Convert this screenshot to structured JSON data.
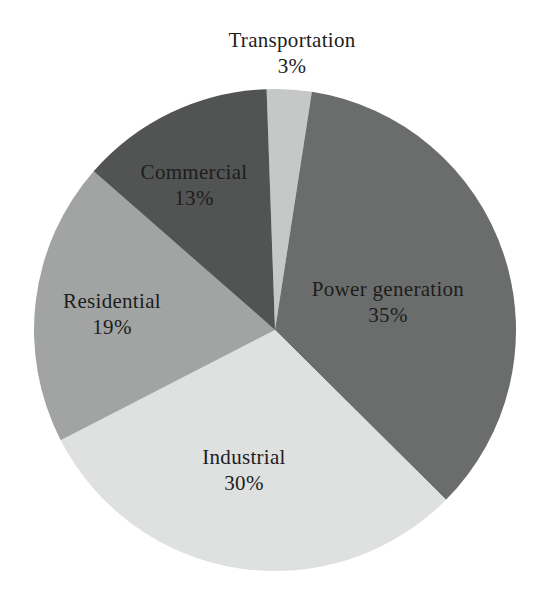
{
  "figure": {
    "background": "#ffffff",
    "text_color": "#1d1d1d"
  },
  "chart_data": {
    "type": "pie",
    "title": "",
    "categories": [
      "Transportation",
      "Power generation",
      "Industrial",
      "Residential",
      "Commercial"
    ],
    "values": [
      3,
      35,
      30,
      19,
      13
    ],
    "unit": "%",
    "slices": [
      {
        "label": "Transportation",
        "value": 3,
        "display": "3%",
        "color": "#c6c8c7"
      },
      {
        "label": "Power generation",
        "value": 35,
        "display": "35%",
        "color": "#6b6d6c"
      },
      {
        "label": "Industrial",
        "value": 30,
        "display": "30%",
        "color": "#dfe1e0"
      },
      {
        "label": "Residential",
        "value": 19,
        "display": "19%",
        "color": "#a2a4a3"
      },
      {
        "label": "Commercial",
        "value": 13,
        "display": "13%",
        "color": "#525453"
      }
    ],
    "legend": "none",
    "grid": false,
    "layout": {
      "start_angle_deg": -2,
      "clockwise": true,
      "center": [
        275,
        330
      ],
      "radius": 241,
      "line_gap": 26,
      "label_anchors": {
        "Transportation": [
          292,
          47
        ],
        "Power generation": [
          388,
          296
        ],
        "Industrial": [
          244,
          464
        ],
        "Residential": [
          112,
          308
        ],
        "Commercial": [
          194,
          179
        ]
      }
    }
  }
}
